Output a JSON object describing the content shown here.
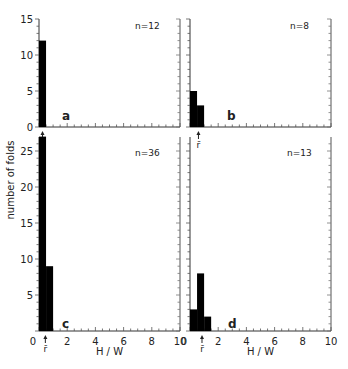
{
  "figure": {
    "ylabel": "number of folds",
    "xlabel": "H / W",
    "mean_marker_label": "r̄"
  },
  "chart_data": [
    {
      "type": "bar",
      "panel": "a",
      "annotation": "n=12",
      "bins": [
        [
          0,
          0.5
        ]
      ],
      "values": [
        12
      ],
      "xlabel": "",
      "ylabel": "number of folds",
      "xlim": [
        0,
        10
      ],
      "ylim": [
        0,
        15
      ],
      "yticks": [
        0,
        5,
        10,
        15
      ],
      "mean_marker_x": 0.25,
      "grid": false
    },
    {
      "type": "bar",
      "panel": "b",
      "annotation": "n=8",
      "bins": [
        [
          0,
          0.5
        ],
        [
          0.5,
          1.0
        ]
      ],
      "values": [
        5,
        3
      ],
      "xlabel": "",
      "ylabel": "",
      "xlim": [
        0,
        10
      ],
      "ylim": [
        0,
        15
      ],
      "mean_marker_x": 0.6,
      "grid": false
    },
    {
      "type": "bar",
      "panel": "c",
      "annotation": "n=36",
      "bins": [
        [
          0,
          0.5
        ],
        [
          0.5,
          1.0
        ]
      ],
      "values": [
        27,
        9
      ],
      "xlabel": "H / W",
      "ylabel": "number of folds",
      "xlim": [
        0,
        10
      ],
      "ylim": [
        0,
        27
      ],
      "yticks": [
        5,
        10,
        15,
        20,
        25
      ],
      "xticks": [
        0,
        2,
        4,
        6,
        8,
        10
      ],
      "mean_marker_x": 0.45,
      "grid": false
    },
    {
      "type": "bar",
      "panel": "d",
      "annotation": "n=13",
      "bins": [
        [
          0,
          0.5
        ],
        [
          0.5,
          1.0
        ],
        [
          1.0,
          1.5
        ]
      ],
      "values": [
        3,
        8,
        2
      ],
      "xlabel": "H / W",
      "ylabel": "",
      "xlim": [
        0,
        10
      ],
      "ylim": [
        0,
        27
      ],
      "xticks": [
        0,
        2,
        4,
        6,
        8,
        10
      ],
      "mean_marker_x": 0.85,
      "grid": false
    }
  ]
}
